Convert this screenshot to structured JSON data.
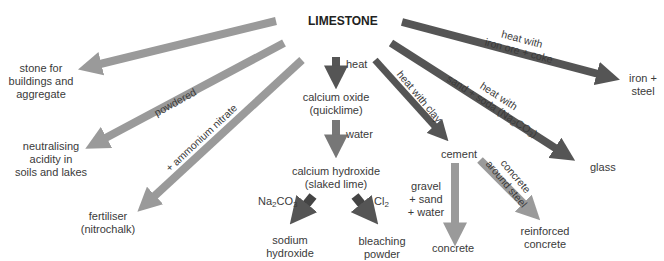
{
  "diagram": {
    "title": "LIMESTONE",
    "colors": {
      "dark_arrow": "#555555",
      "light_arrow": "#9a9a9a",
      "mid_arrow": "#777777",
      "text": "#3a3a3a"
    },
    "nodes": {
      "stone": [
        "stone for",
        "buildings and",
        "aggregate"
      ],
      "neutralising": [
        "neutralising",
        "acidity in",
        "soils and lakes"
      ],
      "fertiliser": [
        "fertiliser",
        "(nitrochalk)"
      ],
      "calcium_oxide": [
        "calcium oxide",
        "(quicklime)"
      ],
      "calcium_hydroxide": [
        "calcium hydroxide",
        "(slaked lime)"
      ],
      "sodium_hydroxide": [
        "sodium",
        "hydroxide"
      ],
      "bleaching_powder": [
        "bleaching",
        "powder"
      ],
      "cement": "cement",
      "concrete": "concrete",
      "reinforced_concrete": [
        "reinforced",
        "concrete"
      ],
      "glass": "glass",
      "iron_steel": [
        "iron +",
        "steel"
      ]
    },
    "edge_labels": {
      "powdered": "powdered",
      "ammonium_nitrate": "+ ammonium nitrate",
      "heat": "heat",
      "water": "water",
      "na2co3_base": "Na",
      "na2co3_sub1": "2",
      "na2co3_mid": "CO",
      "na2co3_sub2": "3",
      "cl_base": "Cl",
      "cl_sub": "2",
      "heat_with_clay": "heat with clay",
      "glass_line1": "heat with",
      "glass_line2_a": "sand + soda (Na",
      "glass_line2_b": "CO",
      "glass_line2_c": ")",
      "iron_line1": "heat with",
      "iron_line2": "iron ore + coke",
      "gravel": [
        "gravel",
        "+ sand",
        "+ water"
      ],
      "concrete_steel": [
        "concrete",
        "around steel"
      ]
    }
  }
}
